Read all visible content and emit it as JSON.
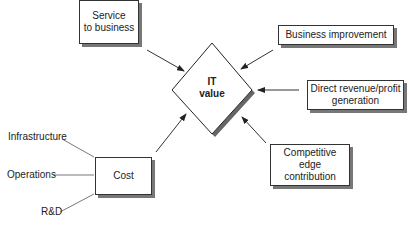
{
  "diagram": {
    "center": {
      "line1": "IT",
      "line2": "value"
    },
    "boxes": {
      "service": {
        "line1": "Service",
        "line2": "to business"
      },
      "business_improvement": {
        "label": "Business improvement"
      },
      "direct_revenue": {
        "line1": "Direct revenue/profit",
        "line2": "generation"
      },
      "competitive_edge": {
        "line1": "Competitive",
        "line2": "edge",
        "line3": "contribution"
      },
      "cost": {
        "label": "Cost"
      }
    },
    "cost_inputs": {
      "infrastructure": "Infrastructure",
      "operations": "Operations",
      "rd": "R&D"
    }
  }
}
